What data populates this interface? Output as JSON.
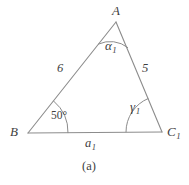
{
  "figure": {
    "caption": "(a)",
    "type": "triangle-diagram",
    "stroke_color": "#8c8c8c",
    "text_color": "#3f3f3f",
    "background_color": "#ffffff"
  },
  "vertices": [
    {
      "id": "A",
      "label": "A",
      "sub": "",
      "x": 116,
      "y": 22
    },
    {
      "id": "B",
      "label": "B",
      "sub": "",
      "x": 28,
      "y": 133
    },
    {
      "id": "C1",
      "label": "C",
      "sub": "1",
      "x": 162,
      "y": 132
    }
  ],
  "sides": [
    {
      "id": "AB",
      "label": "6",
      "sub": "",
      "from": "A",
      "to": "B"
    },
    {
      "id": "AC",
      "label": "5",
      "sub": "",
      "from": "A",
      "to": "C1"
    },
    {
      "id": "BC",
      "label": "a",
      "sub": "1",
      "from": "B",
      "to": "C1"
    }
  ],
  "angles": [
    {
      "id": "alpha1",
      "at": "A",
      "label": "α",
      "sub": "1",
      "style": "italic",
      "arc_radius": 22
    },
    {
      "id": "beta",
      "at": "B",
      "label": "50°",
      "sub": "",
      "style": "upright",
      "arc_radius": 30
    },
    {
      "id": "gamma1",
      "at": "C1",
      "label": "γ",
      "sub": "1",
      "style": "italic",
      "arc_radius": 28
    }
  ]
}
